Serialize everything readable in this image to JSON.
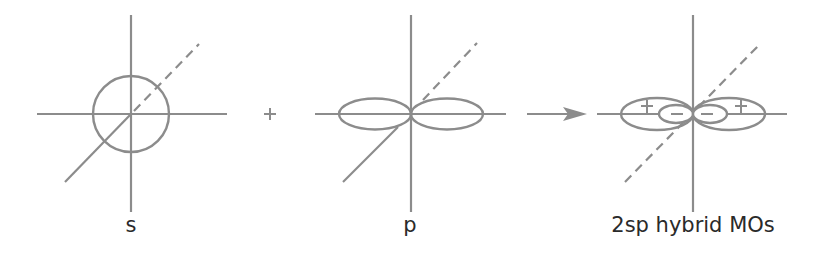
{
  "figure": {
    "line_color": "#8c8c8c",
    "text_color": "#2a2a2a",
    "panels": [
      {
        "id": "s",
        "label": "s",
        "orbital": "s-orbital (sphere)"
      },
      {
        "id": "p",
        "label": "p",
        "orbital": "p-orbital (two lobes)"
      },
      {
        "id": "hybrid",
        "label": "2sp hybrid MOs",
        "orbital": "two sp hybrid orbitals",
        "signs": {
          "large_lobe": "+",
          "small_lobe": "−"
        }
      }
    ],
    "operators": {
      "plus": "+",
      "arrow": "→"
    }
  }
}
